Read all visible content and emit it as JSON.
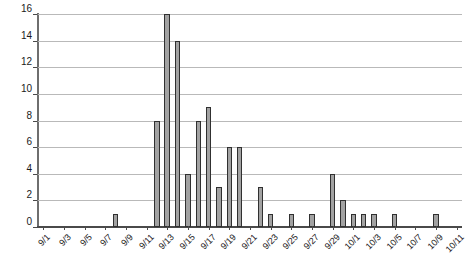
{
  "chart_data": {
    "type": "bar",
    "title": "",
    "subtitle": "",
    "xlabel": "",
    "ylabel": "",
    "ylim": [
      0,
      16
    ],
    "ytick_step": 2,
    "yticks": [
      0,
      2,
      4,
      6,
      8,
      10,
      12,
      14,
      16
    ],
    "ytick_labels": [
      "0",
      "2",
      "4",
      "6",
      "8",
      "10",
      "12",
      "14",
      "16"
    ],
    "grid": true,
    "grid_axis": "y",
    "legend": false,
    "legend_position": "none",
    "xtick_interval": 2,
    "xtick_rotation": -45,
    "bar_color": "#a2a2a2",
    "bar_edge_color": "#303030",
    "background_color": "#ffffff",
    "gridline_color": "#b9b9b9",
    "axis_color": "#4a4a4a",
    "categories": [
      "9/1",
      "9/2",
      "9/3",
      "9/4",
      "9/5",
      "9/6",
      "9/7",
      "9/8",
      "9/9",
      "9/10",
      "9/11",
      "9/12",
      "9/13",
      "9/14",
      "9/15",
      "9/16",
      "9/17",
      "9/18",
      "9/19",
      "9/20",
      "9/21",
      "9/22",
      "9/23",
      "9/24",
      "9/25",
      "9/26",
      "9/27",
      "9/28",
      "9/29",
      "9/30",
      "10/1",
      "10/2",
      "10/3",
      "10/4",
      "10/5",
      "10/6",
      "10/7",
      "10/8",
      "10/9",
      "10/10",
      "10/11"
    ],
    "values": [
      0,
      0,
      0,
      0,
      0,
      0,
      0,
      1,
      0,
      0,
      0,
      8,
      16,
      14,
      4,
      8,
      9,
      3,
      6,
      6,
      0,
      3,
      1,
      0,
      1,
      0,
      1,
      0,
      4,
      2,
      1,
      1,
      1,
      0,
      1,
      0,
      0,
      0,
      1,
      0,
      0
    ],
    "xtick_labels": [
      "9/1",
      "9/3",
      "9/5",
      "9/7",
      "9/9",
      "9/11",
      "9/13",
      "9/15",
      "9/17",
      "9/19",
      "9/21",
      "9/23",
      "9/25",
      "9/27",
      "9/29",
      "10/1",
      "10/3",
      "10/5",
      "10/7",
      "10/9",
      "10/11"
    ],
    "xtick_indices": [
      0,
      2,
      4,
      6,
      8,
      10,
      12,
      14,
      16,
      18,
      20,
      22,
      24,
      26,
      28,
      30,
      32,
      34,
      36,
      38,
      40
    ]
  }
}
